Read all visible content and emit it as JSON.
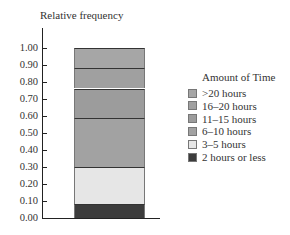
{
  "chart_data": {
    "type": "bar",
    "subtype": "stacked-100",
    "title": "",
    "xlabel": "",
    "ylabel": "Relative frequency",
    "ylim": [
      0,
      1.0
    ],
    "yticks": [
      "0.00",
      "0.10",
      "0.20",
      "0.30",
      "0.40",
      "0.50",
      "0.60",
      "0.70",
      "0.80",
      "0.90",
      "1.00"
    ],
    "grid": false,
    "legend_position": "right",
    "legend_title": "Amount of Time",
    "categories": [
      ""
    ],
    "series": [
      {
        "name": "2 hours or less",
        "values": [
          0.08
        ],
        "color": "#3c3c3c"
      },
      {
        "name": "3–5 hours",
        "values": [
          0.22
        ],
        "color": "#e6e6e6"
      },
      {
        "name": "6–10 hours",
        "values": [
          0.29
        ],
        "color": "#a2a2a2"
      },
      {
        "name": "11–15 hours",
        "values": [
          0.17
        ],
        "color": "#9c9c9c"
      },
      {
        "name": "16–20 hours",
        "values": [
          0.12
        ],
        "color": "#a0a0a0"
      },
      {
        "name": ">20 hours",
        "values": [
          0.12
        ],
        "color": "#a6a6a6"
      }
    ],
    "cumulative_boundaries": [
      0.0,
      0.08,
      0.3,
      0.59,
      0.76,
      0.88,
      1.0
    ]
  },
  "axis": {
    "ylabel": "Relative frequency",
    "ticks": [
      "1.00",
      "0.90",
      "0.80",
      "0.70",
      "0.60",
      "0.50",
      "0.40",
      "0.30",
      "0.20",
      "0.10",
      "0.00"
    ]
  },
  "legend": {
    "title": "Amount of Time",
    "items": [
      {
        "label": ">20 hours",
        "color": "#a6a6a6"
      },
      {
        "label": "16–20 hours",
        "color": "#a0a0a0"
      },
      {
        "label": "11–15 hours",
        "color": "#9c9c9c"
      },
      {
        "label": "6–10 hours",
        "color": "#a2a2a2"
      },
      {
        "label": "3–5 hours",
        "color": "#e6e6e6"
      },
      {
        "label": "2 hours or less",
        "color": "#3c3c3c"
      }
    ]
  }
}
